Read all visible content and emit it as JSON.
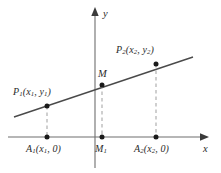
{
  "figure": {
    "background_color": "#ffffff",
    "axis_color": "#6e6e6e",
    "line_color": "#4a4a4a",
    "dash_color": "#a8a8a8",
    "point_color": "#1a1a1a",
    "text_color": "#2b2b2b",
    "axes": {
      "x_label": "x",
      "y_label": "y",
      "origin_px": {
        "x": 95,
        "y": 137
      }
    },
    "segment": {
      "start_px": {
        "x": 14,
        "y": 117
      },
      "end_px": {
        "x": 193,
        "y": 57
      }
    },
    "points": [
      {
        "id": "P1",
        "label_base": "P",
        "label_sub": "1",
        "coord_text": "(x₁, y₁)",
        "x_symbol": "x",
        "x_sub": "1",
        "y_symbol": "y",
        "y_sub": "1",
        "px": {
          "x": 47,
          "y": 106
        }
      },
      {
        "id": "M",
        "label_base": "M",
        "label_sub": "",
        "coord_text": "",
        "px": {
          "x": 102,
          "y": 85
        }
      },
      {
        "id": "P2",
        "label_base": "P",
        "label_sub": "2",
        "coord_text": "(x₂, y₂)",
        "x_symbol": "x",
        "x_sub": "2",
        "y_symbol": "y",
        "y_sub": "2",
        "px": {
          "x": 156,
          "y": 64
        }
      }
    ],
    "foot_points": [
      {
        "id": "A1",
        "label_base": "A",
        "label_sub": "1",
        "coord_text": "(x₁, 0)",
        "x_symbol": "x",
        "x_sub": "1",
        "zero": "0",
        "px": {
          "x": 47,
          "y": 137
        }
      },
      {
        "id": "M1",
        "label_base": "M",
        "label_sub": "1",
        "coord_text": "",
        "px": {
          "x": 102,
          "y": 137
        }
      },
      {
        "id": "A2",
        "label_base": "A",
        "label_sub": "2",
        "coord_text": "(x₂, 0)",
        "x_symbol": "x",
        "x_sub": "2",
        "zero": "0",
        "px": {
          "x": 156,
          "y": 137
        }
      }
    ],
    "labels": {
      "p1_base": "P",
      "p1_sub": "1",
      "p1_open": "(",
      "p1_x": "x",
      "p1_xsub": "1",
      "p1_comma": ", ",
      "p1_y": "y",
      "p1_ysub": "1",
      "p1_close": ")",
      "p2_base": "P",
      "p2_sub": "2",
      "p2_open": "(",
      "p2_x": "x",
      "p2_xsub": "2",
      "p2_comma": ", ",
      "p2_y": "y",
      "p2_ysub": "2",
      "p2_close": ")",
      "m_base": "M",
      "a1_base": "A",
      "a1_sub": "1",
      "a1_open": "(",
      "a1_x": "x",
      "a1_xsub": "1",
      "a1_comma": ", ",
      "a1_zero": "0",
      "a1_close": ")",
      "m1_base": "M",
      "m1_sub": "1",
      "a2_base": "A",
      "a2_sub": "2",
      "a2_open": "(",
      "a2_x": "x",
      "a2_xsub": "2",
      "a2_comma": ", ",
      "a2_zero": "0",
      "a2_close": ")",
      "axis_x": "x",
      "axis_y": "y"
    }
  }
}
